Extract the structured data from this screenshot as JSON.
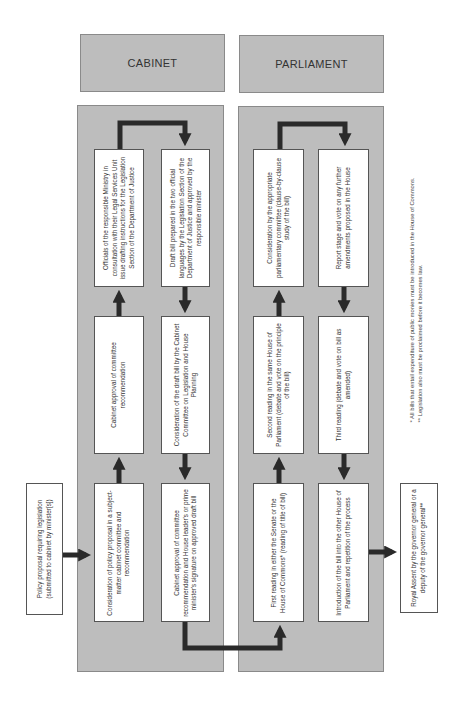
{
  "diagram": {
    "type": "flowchart",
    "orientation": "rotated-90-ccw",
    "colors": {
      "panel_fill": "#bdbdbd",
      "panel_border": "#8a8a8a",
      "box_fill": "#ffffff",
      "arrow": "#2a2a2a"
    },
    "headers": {
      "cabinet": "CABINET",
      "parliament": "PARLIAMENT"
    },
    "start": {
      "text": "Policy proposal requiring legislation (submitted to cabinet by minister[s])"
    },
    "cabinet_steps": [
      {
        "id": "c1",
        "text": "Consideration of policy proposal in a subject-matter cabinet committee and recommendation"
      },
      {
        "id": "c2",
        "text": "Cabinet approval of committee recommendation"
      },
      {
        "id": "c3",
        "text": "Officials of the responsible Ministry in consultation with their Legal Services Unit issue drafting instructions for the Legislation Section of the Department of Justice"
      },
      {
        "id": "c4",
        "text": "Draft bill prepared in the two official languages by the Legislation Section of the Department of Justice and approved by the responsible minister"
      },
      {
        "id": "c5",
        "text": "Consideration of the draft bill by the Cabinet Committee on Legislation and House Planning"
      },
      {
        "id": "c6",
        "text": "Cabinet approval of committee recommendation and House leader's or prime minister's signature on approved draft bill"
      }
    ],
    "parliament_steps": [
      {
        "id": "p1",
        "text": "First reading in either the Senate or the House of Commons* (reading of title of bill)"
      },
      {
        "id": "p2",
        "text": "Second reading in the same House of Parliament (debate and vote on the principle of the bill)"
      },
      {
        "id": "p3",
        "text": "Consideration by the appropriate parliamentary committee (clause-by-clause study of the bill)"
      },
      {
        "id": "p4",
        "text": "Report stage and vote on any further amendments proposed in the House"
      },
      {
        "id": "p5",
        "text": "Third reading (debate and vote on bill as amended)"
      },
      {
        "id": "p6",
        "text": "Introduction of the bill into the other House of Parliament and repetition of the process"
      }
    ],
    "end": {
      "text": "Royal Assent by the governor general or a deputy of the governor general**"
    },
    "footnotes": [
      "* All bills that entail expenditure of public monies must be introduced in the House of Commons.",
      "** Legislation also must be proclaimed before it becomes law."
    ],
    "flow": [
      "start",
      "c1",
      "c2",
      "c3",
      "c4",
      "c5",
      "c6",
      "p1",
      "p2",
      "p3",
      "p4",
      "p5",
      "p6",
      "end"
    ]
  }
}
